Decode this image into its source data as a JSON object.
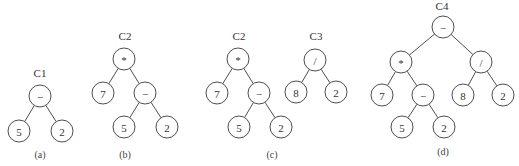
{
  "diagram": {
    "type": "expression-trees",
    "node_radius": 11,
    "colors": {
      "stroke": "#3a3a3a",
      "text": "#333333",
      "background": "#ffffff"
    },
    "panels": [
      {
        "caption": "(a)",
        "caption_pos": [
          40,
          158
        ],
        "trees": [
          {
            "label": "C1",
            "label_pos": [
              40,
              77
            ],
            "nodes": [
              {
                "id": "a_root",
                "text": "−",
                "x": 40,
                "y": 96
              },
              {
                "id": "a_l",
                "text": "5",
                "x": 19,
                "y": 131
              },
              {
                "id": "a_r",
                "text": "2",
                "x": 62,
                "y": 131
              }
            ],
            "edges": [
              [
                "a_root",
                "a_l"
              ],
              [
                "a_root",
                "a_r"
              ]
            ]
          }
        ]
      },
      {
        "caption": "(b)",
        "caption_pos": [
          125,
          158
        ],
        "trees": [
          {
            "label": "C2",
            "label_pos": [
              125,
              40
            ],
            "nodes": [
              {
                "id": "b_root",
                "text": "*",
                "x": 124,
                "y": 59
              },
              {
                "id": "b_7",
                "text": "7",
                "x": 103,
                "y": 93
              },
              {
                "id": "b_minus",
                "text": "−",
                "x": 145,
                "y": 93
              },
              {
                "id": "b_5",
                "text": "5",
                "x": 124,
                "y": 127
              },
              {
                "id": "b_2",
                "text": "2",
                "x": 167,
                "y": 127
              }
            ],
            "edges": [
              [
                "b_root",
                "b_7"
              ],
              [
                "b_root",
                "b_minus"
              ],
              [
                "b_minus",
                "b_5"
              ],
              [
                "b_minus",
                "b_2"
              ]
            ]
          }
        ]
      },
      {
        "caption": "(c)",
        "caption_pos": [
          272,
          158
        ],
        "trees": [
          {
            "label": "C2",
            "label_pos": [
              239,
              40
            ],
            "nodes": [
              {
                "id": "c_root",
                "text": "*",
                "x": 238,
                "y": 59
              },
              {
                "id": "c_7",
                "text": "7",
                "x": 217,
                "y": 93
              },
              {
                "id": "c_minus",
                "text": "−",
                "x": 259,
                "y": 93
              },
              {
                "id": "c_5",
                "text": "5",
                "x": 239,
                "y": 127
              },
              {
                "id": "c_2",
                "text": "2",
                "x": 281,
                "y": 127
              }
            ],
            "edges": [
              [
                "c_root",
                "c_7"
              ],
              [
                "c_root",
                "c_minus"
              ],
              [
                "c_minus",
                "c_5"
              ],
              [
                "c_minus",
                "c_2"
              ]
            ]
          },
          {
            "label": "C3",
            "label_pos": [
              316,
              40
            ],
            "nodes": [
              {
                "id": "c3_root",
                "text": "/",
                "x": 315,
                "y": 60
              },
              {
                "id": "c3_8",
                "text": "8",
                "x": 296,
                "y": 92
              },
              {
                "id": "c3_2",
                "text": "2",
                "x": 336,
                "y": 92
              }
            ],
            "edges": [
              [
                "c3_root",
                "c3_8"
              ],
              [
                "c3_root",
                "c3_2"
              ]
            ]
          }
        ]
      },
      {
        "caption": "(d)",
        "caption_pos": [
          443,
          155
        ],
        "trees": [
          {
            "label": "C4",
            "label_pos": [
              442,
              10
            ],
            "nodes": [
              {
                "id": "d_root",
                "text": "−",
                "x": 443,
                "y": 27
              },
              {
                "id": "d_mul",
                "text": "*",
                "x": 401,
                "y": 62
              },
              {
                "id": "d_div",
                "text": "/",
                "x": 481,
                "y": 62
              },
              {
                "id": "d_7",
                "text": "7",
                "x": 382,
                "y": 95
              },
              {
                "id": "d_minus",
                "text": "−",
                "x": 423,
                "y": 95
              },
              {
                "id": "d_8",
                "text": "8",
                "x": 463,
                "y": 95
              },
              {
                "id": "d_2a",
                "text": "2",
                "x": 503,
                "y": 95
              },
              {
                "id": "d_5",
                "text": "5",
                "x": 402,
                "y": 127
              },
              {
                "id": "d_2b",
                "text": "2",
                "x": 444,
                "y": 127
              }
            ],
            "edges": [
              [
                "d_root",
                "d_mul"
              ],
              [
                "d_root",
                "d_div"
              ],
              [
                "d_mul",
                "d_7"
              ],
              [
                "d_mul",
                "d_minus"
              ],
              [
                "d_div",
                "d_8"
              ],
              [
                "d_div",
                "d_2a"
              ],
              [
                "d_minus",
                "d_5"
              ],
              [
                "d_minus",
                "d_2b"
              ]
            ]
          }
        ]
      }
    ]
  }
}
